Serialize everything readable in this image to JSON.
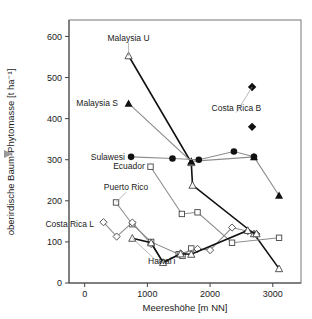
{
  "figure": {
    "gutter_marker_icon": "triangle-right-icon",
    "gutter_marker_color": "#9a9a9a",
    "background": "#ffffff"
  },
  "chart_data": {
    "type": "line",
    "title": "",
    "subtitle": "",
    "xlabel": "Meereshöhe [m NN]",
    "ylabel": "oberirdische Baum-Phytomasse [t ha⁻¹]",
    "xlim": [
      -250,
      3450
    ],
    "ylim": [
      0,
      640
    ],
    "xticks": [
      0,
      1000,
      2000,
      3000
    ],
    "xtick_labels": [
      "0",
      "1000",
      "2000",
      "3000"
    ],
    "yticks": [
      0,
      100,
      200,
      300,
      400,
      500,
      600
    ],
    "ytick_labels": [
      "0",
      "100",
      "200",
      "300",
      "400",
      "500",
      "600"
    ],
    "grid": false,
    "legend": "inline-annotations",
    "series": [
      {
        "name": "Malaysia U",
        "label": "Malaysia U",
        "marker": "triangle-open",
        "line": "dark",
        "label_x": 700,
        "label_y": 597,
        "label_anchor": "middle",
        "points": [
          {
            "x": 700,
            "y": 553
          },
          {
            "x": 1700,
            "y": 293
          },
          {
            "x": 1720,
            "y": 238
          },
          {
            "x": 2700,
            "y": 120
          },
          {
            "x": 3100,
            "y": 35
          }
        ]
      },
      {
        "name": "Malaysia S",
        "label": "Malaysia S",
        "marker": "triangle-filled",
        "line": "gray",
        "label_x": 530,
        "label_y": 437,
        "label_anchor": "end",
        "points": [
          {
            "x": 700,
            "y": 437
          },
          {
            "x": 1700,
            "y": 296
          },
          {
            "x": 2700,
            "y": 307
          },
          {
            "x": 3100,
            "y": 213
          }
        ]
      },
      {
        "name": "Sulawesi",
        "label": "Sulawesi",
        "marker": "circle-filled",
        "line": "gray",
        "label_x": 640,
        "label_y": 307,
        "label_anchor": "end",
        "points": [
          {
            "x": 740,
            "y": 307
          },
          {
            "x": 1400,
            "y": 303
          },
          {
            "x": 1820,
            "y": 300
          },
          {
            "x": 2380,
            "y": 320
          },
          {
            "x": 2700,
            "y": 307
          }
        ]
      },
      {
        "name": "Ecuador",
        "label": "Ecuador",
        "marker": "square-open",
        "line": "gray",
        "label_x": 960,
        "label_y": 285,
        "label_anchor": "end",
        "points": [
          {
            "x": 1050,
            "y": 283
          },
          {
            "x": 1550,
            "y": 168
          },
          {
            "x": 1800,
            "y": 172
          },
          {
            "x": 2350,
            "y": 98
          },
          {
            "x": 3100,
            "y": 110
          }
        ]
      },
      {
        "name": "Puerto Rico",
        "label": "Puerto Rico",
        "marker": "square-open",
        "line": "gray",
        "label_x": 660,
        "label_y": 233,
        "label_anchor": "middle",
        "points": [
          {
            "x": 500,
            "y": 196
          },
          {
            "x": 760,
            "y": 143
          },
          {
            "x": 1060,
            "y": 100
          },
          {
            "x": 1500,
            "y": 70
          },
          {
            "x": 1560,
            "y": 66
          },
          {
            "x": 1700,
            "y": 84
          }
        ]
      },
      {
        "name": "Costa Rica L",
        "label": "Costa Rica L",
        "marker": "diamond-open",
        "line": "gray",
        "label_x": 150,
        "label_y": 143,
        "label_anchor": "end",
        "points": [
          {
            "x": 300,
            "y": 148
          },
          {
            "x": 510,
            "y": 113
          },
          {
            "x": 760,
            "y": 147
          },
          {
            "x": 1060,
            "y": 95
          },
          {
            "x": 1250,
            "y": 50
          },
          {
            "x": 1530,
            "y": 72
          },
          {
            "x": 1800,
            "y": 83
          },
          {
            "x": 2000,
            "y": 80
          },
          {
            "x": 2350,
            "y": 135
          },
          {
            "x": 2600,
            "y": 126
          },
          {
            "x": 2740,
            "y": 119
          }
        ]
      },
      {
        "name": "Hawai'i",
        "label": "Hawaiʻi",
        "marker": "triangle-open",
        "line": "dark",
        "label_x": 1230,
        "label_y": 54,
        "label_anchor": "middle",
        "points": [
          {
            "x": 760,
            "y": 109
          },
          {
            "x": 1060,
            "y": 98
          },
          {
            "x": 1250,
            "y": 50
          },
          {
            "x": 1530,
            "y": 71
          },
          {
            "x": 1700,
            "y": 70
          },
          {
            "x": 2600,
            "y": 128
          },
          {
            "x": 2740,
            "y": 120
          }
        ]
      },
      {
        "name": "Costa Rica B",
        "label": "Costa Rica B",
        "marker": "diamond-filled",
        "line": "none",
        "label_x": 2420,
        "label_y": 427,
        "label_anchor": "middle",
        "points": [
          {
            "x": 2670,
            "y": 477
          },
          {
            "x": 2670,
            "y": 380
          }
        ]
      }
    ]
  }
}
